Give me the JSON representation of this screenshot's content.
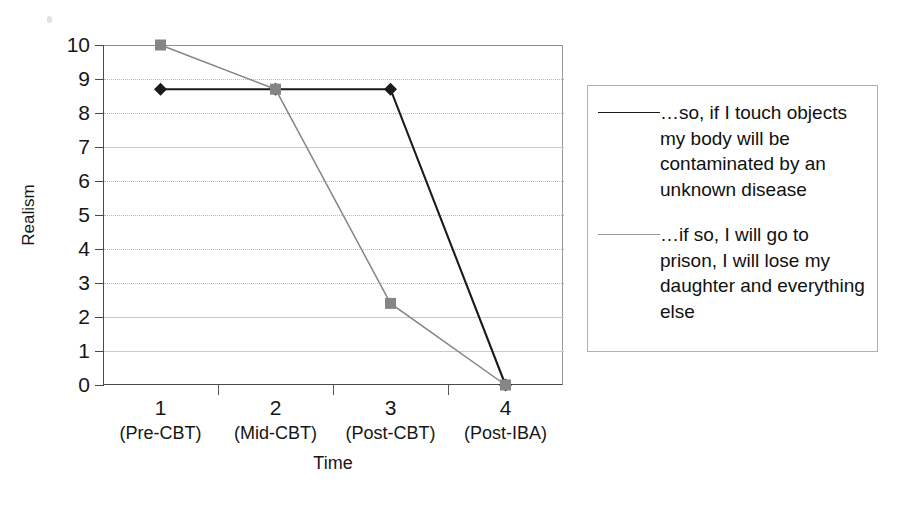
{
  "chart_data": {
    "type": "line",
    "title": "",
    "xlabel": "Time",
    "ylabel": "Realism",
    "ylim": [
      0,
      10
    ],
    "ytick_values": [
      0,
      1,
      2,
      3,
      4,
      5,
      6,
      7,
      8,
      9,
      10
    ],
    "ytick_labels": [
      "0",
      "1",
      "2",
      "3",
      "4",
      "5",
      "6",
      "7",
      "8",
      "9",
      "10"
    ],
    "categories": [
      "1",
      "2",
      "3",
      "4"
    ],
    "category_sublabels": [
      "(Pre-CBT)",
      "(Mid-CBT)",
      "(Post-CBT)",
      "(Post-IBA)"
    ],
    "grid": "horizontal",
    "legend_position": "right",
    "series": [
      {
        "name": "…so, if I touch objects my body will be contaminated by an unknown disease",
        "marker": "diamond",
        "color": "#1b1b1b",
        "values": [
          8.7,
          8.7,
          8.7,
          0
        ]
      },
      {
        "name": "…if so, I will go to prison, I will lose my daughter and everything else",
        "marker": "square",
        "color": "#858585",
        "values": [
          10,
          8.7,
          2.4,
          0
        ]
      }
    ]
  },
  "axes": {
    "y_title": "Realism",
    "x_title": "Time"
  },
  "legend": {
    "entries": [
      {
        "marker": "diamond-marker",
        "label": "…so, if I touch objects my body will be contaminated by an unknown disease"
      },
      {
        "marker": "square-marker",
        "label": "…if so, I will go to prison, I will lose my daughter and everything else"
      }
    ]
  },
  "colors": {
    "series_1": "#1b1b1b",
    "series_2": "#858585",
    "axis": "#4a4a4a",
    "grid": "#b9b9b9",
    "background": "#ffffff"
  }
}
